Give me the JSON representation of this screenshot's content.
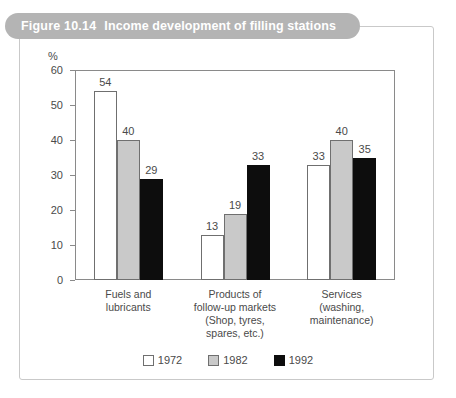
{
  "figure": {
    "number_label": "Figure 10.14",
    "title": "Income development of filling stations",
    "banner_color": "#b4b4b4",
    "banner_text_color": "#ffffff",
    "frame_color": "#c9c9c9"
  },
  "chart_data": {
    "type": "bar",
    "title": "Income development of filling stations",
    "xlabel": "",
    "ylabel": "%",
    "ylim": [
      0,
      60
    ],
    "yticks": [
      0,
      10,
      20,
      30,
      40,
      50,
      60
    ],
    "ytick_labels": [
      "0",
      "10",
      "20",
      "30",
      "40",
      "50",
      "60"
    ],
    "grid": false,
    "legend_position": "bottom",
    "categories": [
      "Fuels and lubricants",
      "Products of follow-up markets (Shop, tyres, spares, etc.)",
      "Services (washing, maintenance)"
    ],
    "category_label_lines": [
      [
        "Fuels and",
        "lubricants"
      ],
      [
        "Products of",
        "follow-up markets",
        "(Shop, tyres,",
        "spares, etc.)"
      ],
      [
        "Services",
        "(washing,",
        "maintenance)"
      ]
    ],
    "series": [
      {
        "name": "1972",
        "color": "#ffffff",
        "values": [
          54,
          13,
          33
        ]
      },
      {
        "name": "1982",
        "color": "#c9c9c9",
        "values": [
          40,
          19,
          40
        ]
      },
      {
        "name": "1992",
        "color": "#0d0d0d",
        "values": [
          29,
          33,
          35
        ]
      }
    ]
  },
  "legend": {
    "items": [
      {
        "label": "1972",
        "swatch": "white-swatch"
      },
      {
        "label": "1982",
        "swatch": "gray-swatch"
      },
      {
        "label": "1992",
        "swatch": "black-swatch"
      }
    ]
  }
}
